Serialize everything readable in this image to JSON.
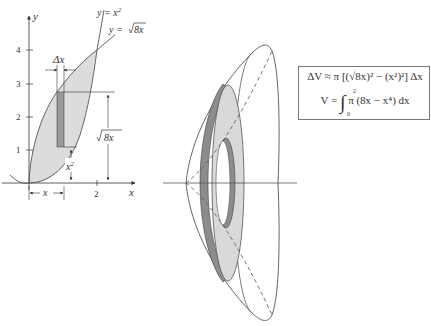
{
  "left_graph": {
    "axes": {
      "x_label": "x",
      "y_label": "y"
    },
    "y_ticks": [
      "1",
      "2",
      "3",
      "4"
    ],
    "x_ticks": [
      "2"
    ],
    "curves": [
      {
        "label_prefix": "y = x",
        "label_sup": "2",
        "name": "parabola"
      },
      {
        "label_prefix": "y = ",
        "label_radicand": "8x",
        "name": "root-curve"
      }
    ],
    "annotations": {
      "delta_x": "Δx",
      "x_base": "x",
      "x_sq": "x",
      "x_sq_sup": "2",
      "sqrt_label": "8x"
    }
  },
  "formula": {
    "line1": "ΔV ≈ π [(√8x)² − (x²)²] Δx",
    "line2_lhs": "V = ",
    "line2_upper": "2",
    "line2_lower": "0",
    "line2_rhs": "π (8x − x⁴) dx",
    "integral_sign": "∫"
  },
  "solid": {
    "description": "washer-shaped slice of solid of revolution about x-axis",
    "colors": {
      "washer_face": "#d9d9d9",
      "washer_edge": "#8c8c8c",
      "outline": "#555555"
    }
  }
}
